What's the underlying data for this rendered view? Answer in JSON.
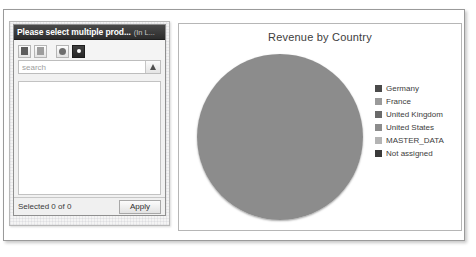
{
  "picker": {
    "dialog": {
      "title": "Please select multiple prod...",
      "title_suffix": "(In L...",
      "toolbar": [
        {
          "name": "select-all-button",
          "icon": "select-all-icon"
        },
        {
          "name": "deselect-all-button",
          "icon": "deselect-all-icon"
        },
        {
          "name": "options-button",
          "icon": "bullet-icon"
        },
        {
          "name": "dropdown-toggle-button",
          "icon": "chevron-down-icon"
        }
      ],
      "search": {
        "placeholder": "search",
        "value": "",
        "button_icon": "search-icon"
      },
      "list_items": [],
      "footer": {
        "selected_text": "Selected 0 of 0",
        "apply_label": "Apply"
      }
    }
  },
  "chart_panel": {
    "title": "Revenue by Country"
  },
  "chart_data": {
    "type": "pie",
    "title": "Revenue by Country",
    "xlabel": "",
    "ylabel": "",
    "legend_position": "right",
    "grid": false,
    "categories": [
      "Germany",
      "France",
      "United Kingdom",
      "United States",
      "MASTER_DATA",
      "Not assigned"
    ],
    "values": [
      23,
      12,
      17,
      48,
      0,
      0
    ],
    "colors": [
      "#4a4a4a",
      "#9a9a9a",
      "#6a6a6a",
      "#8c8c8c",
      "#b4b4b4",
      "#3a3a3a"
    ],
    "slices": [
      {
        "label": "United States",
        "value": 48,
        "color": "#8c8c8c",
        "start_deg": 270,
        "end_deg": 90
      },
      {
        "label": "Germany",
        "value": 23,
        "color": "#4a4a4a",
        "start_deg": 90,
        "end_deg": 173
      },
      {
        "label": "France",
        "value": 12,
        "color": "#9a9a9a",
        "start_deg": 173,
        "end_deg": 217
      },
      {
        "label": "United Kingdom",
        "value": 17,
        "color": "#6a6a6a",
        "start_deg": 217,
        "end_deg": 270
      }
    ]
  }
}
